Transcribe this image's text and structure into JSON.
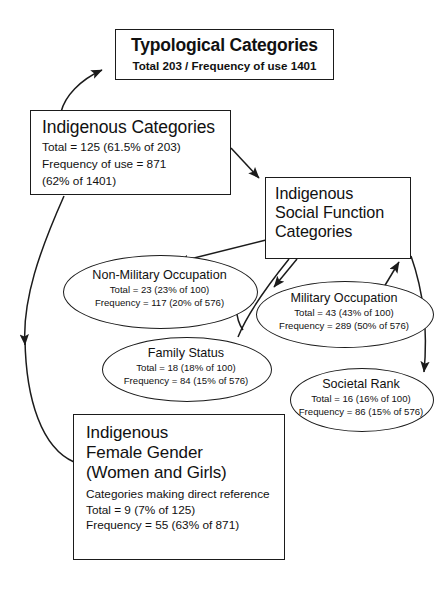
{
  "diagram": {
    "stroke_color": "#1b1b1b",
    "background_color": "#ffffff",
    "nodes": {
      "typological": {
        "title": "Typological Categories",
        "line1": "Total 203 / Frequency of use 1401"
      },
      "indigenous_categories": {
        "title": "Indigenous Categories",
        "line1": "Total = 125 (61.5% of 203)",
        "line2": "Frequency of use = 871",
        "line3": "(62% of 1401)"
      },
      "social_function": {
        "title_line1": "Indigenous",
        "title_line2": "Social Function",
        "title_line3": "Categories"
      },
      "non_military_occupation": {
        "title": "Non-Military Occupation",
        "line1": "Total = 23 (23% of 100)",
        "line2": "Frequency = 117 (20% of 576)"
      },
      "military_occupation": {
        "title": "Military Occupation",
        "line1": "Total = 43 (43% of 100)",
        "line2": "Frequency = 289 (50% of 576)"
      },
      "family_status": {
        "title": "Family Status",
        "line1": "Total = 18 (18% of 100)",
        "line2": "Frequency = 84 (15% of 576)"
      },
      "societal_rank": {
        "title": "Societal Rank",
        "line1": "Total = 16 (16% of 100)",
        "line2": "Frequency = 86 (15% of 576)"
      },
      "female_gender": {
        "title_line1": "Indigenous",
        "title_line2": "Female Gender",
        "title_line3": "(Women and Girls)",
        "subtitle": "Categories making direct reference",
        "line1": "Total = 9 (7% of 125)",
        "line2": "Frequency = 55 (63% of 871)"
      }
    },
    "edges": [
      {
        "name": "indigenous-categories-to-typological",
        "from": "indigenous_categories",
        "to": "typological"
      },
      {
        "name": "indigenous-categories-to-social-function",
        "from": "indigenous_categories",
        "to": "social_function"
      },
      {
        "name": "indigenous-categories-to-female-gender",
        "from": "indigenous_categories",
        "to": "female_gender"
      },
      {
        "name": "social-function-to-non-military",
        "from": "social_function",
        "to": "non_military_occupation"
      },
      {
        "name": "social-function-to-military",
        "from": "social_function",
        "to": "military_occupation"
      },
      {
        "name": "social-function-to-family-status",
        "from": "social_function",
        "to": "family_status"
      },
      {
        "name": "social-function-to-societal-rank",
        "from": "social_function",
        "to": "societal_rank"
      }
    ]
  }
}
